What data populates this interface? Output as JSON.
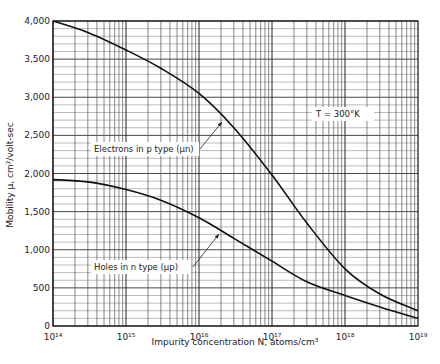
{
  "chart_data": {
    "type": "line",
    "title": "",
    "xlabel": "Impurity concentration N, atoms/cm³",
    "ylabel": "Mobility μ, cm²/volt-sec",
    "xscale": "log",
    "xlim": [
      100000000000000.0,
      1e+19
    ],
    "ylim": [
      0,
      4000
    ],
    "grid": true,
    "x_tick_labels": [
      "10¹⁴",
      "10¹⁵",
      "10¹⁶",
      "10¹⁷",
      "10¹⁸",
      "10¹⁹"
    ],
    "y_tick_labels": [
      "0",
      "500",
      "1,000",
      "1,500",
      "2,000",
      "2,500",
      "3,000",
      "3,500",
      "4,000"
    ],
    "x": [
      100000000000000.0,
      300000000000000.0,
      1000000000000000.0,
      3000000000000000.0,
      1e+16,
      3e+16,
      1e+17,
      3e+17,
      1e+18,
      3e+18,
      1e+19
    ],
    "series": [
      {
        "name": "Electrons in p type (μn)",
        "values": [
          4000,
          3850,
          3620,
          3380,
          3050,
          2600,
          1980,
          1350,
          750,
          420,
          200
        ]
      },
      {
        "name": "Holes in n type (μp)",
        "values": [
          1920,
          1890,
          1790,
          1650,
          1420,
          1150,
          850,
          580,
          400,
          250,
          100
        ]
      }
    ],
    "annotations": [
      {
        "text": "T = 300°K"
      },
      {
        "text": "Electrons in p type (μn)",
        "target_series": 0
      },
      {
        "text": "Holes in n type (μp)",
        "target_series": 1
      }
    ],
    "legend": "none (inline annotations with leader arrows)"
  },
  "labels": {
    "temperature": "T = 300°K",
    "electrons": "Electrons in p type (μn)",
    "holes": "Holes in n type (μp)",
    "xlabel": "Impurity concentration N, atoms/cm³",
    "ylabel": "Mobility μ, cm²/volt-sec"
  }
}
